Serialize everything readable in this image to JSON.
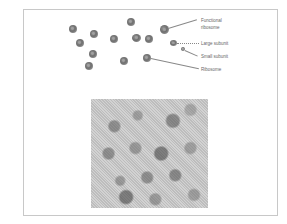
{
  "diagram": {
    "labels": {
      "functional_ribosome_line1": "Functional",
      "functional_ribosome_line2": "ribosome",
      "large_subunit": "Large subunit",
      "small_subunit": "Small subunit",
      "ribosome": "Ribosome"
    },
    "micrograph": {
      "description": "electron micrograph of ribosomes"
    },
    "colors": {
      "frame_border": "#c8c8c8",
      "blob": "#7a7a7a",
      "label_text": "#666666"
    }
  }
}
